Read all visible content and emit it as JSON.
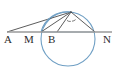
{
  "figure": {
    "background_color": "#ffffff",
    "width": 118,
    "height": 69,
    "colors": {
      "circle_stroke": "#6f9fc4",
      "baseline_stroke": "#9a9a9a",
      "ray_stroke": "#4a4a4a",
      "label_color": "#2b2b2b",
      "angle_mark_color": "#5a5a5a"
    },
    "circle": {
      "name": "main-circle",
      "center_x": 68,
      "center_y": 39,
      "radius": 27,
      "stroke_width": 1.1
    },
    "baseline": {
      "name": "baseline-AN",
      "x1": 7,
      "y1": 32,
      "x2": 112,
      "y2": 32,
      "stroke_width": 1.6
    },
    "points": [
      {
        "id": "A",
        "label": "A",
        "x": 7,
        "y": 32,
        "label_x": 4,
        "label_y": 35
      },
      {
        "id": "M",
        "label": "M",
        "x": 41,
        "y": 32,
        "label_x": 25,
        "label_y": 35
      },
      {
        "id": "B",
        "label": "B",
        "x": 57,
        "y": 32,
        "label_x": 48,
        "label_y": 35
      },
      {
        "id": "N",
        "label": "N",
        "x": 95,
        "y": 32,
        "label_x": 103,
        "label_y": 35
      },
      {
        "id": "P",
        "label": "",
        "x": 71,
        "y": 12,
        "label_x": 0,
        "label_y": 0
      }
    ],
    "segments": [
      {
        "name": "segment-A-P",
        "from": "A",
        "to": "P"
      },
      {
        "name": "segment-M-P",
        "from": "M",
        "to": "P"
      },
      {
        "name": "segment-B-P",
        "from": "B",
        "to": "P"
      },
      {
        "name": "segment-N-P",
        "from": "N",
        "to": "P"
      },
      {
        "name": "segment-M-N-chord",
        "from": "M",
        "to": "N"
      }
    ],
    "angle_marks": [
      {
        "name": "angle-mark-left",
        "cx": 66,
        "cy": 17,
        "r": 4.5,
        "start_deg": 250,
        "end_deg": 300
      },
      {
        "name": "angle-mark-right",
        "cx": 71,
        "cy": 17,
        "r": 5.5,
        "start_deg": 255,
        "end_deg": 310
      }
    ]
  }
}
